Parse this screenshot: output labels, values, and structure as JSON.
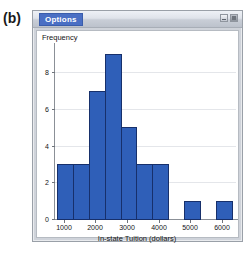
{
  "panel_label": "(b)",
  "window": {
    "options_tab_label": "Options",
    "controls": [
      {
        "name": "minimize-button",
        "glyph": "‒"
      },
      {
        "name": "close-button",
        "glyph": "■"
      }
    ]
  },
  "colors": {
    "bar_fill": "#2f5fb8",
    "bar_border": "#17306b",
    "tab_accent": "#4a6fc4",
    "window_chrome": "#cfd3da",
    "grid": "#e4e6ea",
    "axis": "#8b9097"
  },
  "chart_data": {
    "type": "bar",
    "title": "",
    "subtitle": "",
    "xlabel": "In-state Tuition (dollars)",
    "ylabel": "Frequency",
    "xlim": [
      700,
      6500
    ],
    "ylim": [
      0,
      9.6
    ],
    "xticks": [
      1000,
      2000,
      3000,
      4000,
      5000,
      6000
    ],
    "xtick_labels": [
      "1000",
      "2000",
      "3000",
      "4000",
      "5000",
      "6000"
    ],
    "yticks": [
      0,
      2,
      4,
      6,
      8
    ],
    "ytick_labels": [
      "0",
      "2",
      "4",
      "6",
      "8"
    ],
    "grid": true,
    "grid_axis": "y",
    "legend": null,
    "bin_width": 500,
    "bins": [
      {
        "left": 800,
        "right": 1300,
        "value": 3
      },
      {
        "left": 1300,
        "right": 1800,
        "value": 3
      },
      {
        "left": 1800,
        "right": 2300,
        "value": 7
      },
      {
        "left": 2300,
        "right": 2800,
        "value": 9
      },
      {
        "left": 2800,
        "right": 3300,
        "value": 5
      },
      {
        "left": 3300,
        "right": 3800,
        "value": 3
      },
      {
        "left": 3800,
        "right": 4300,
        "value": 3
      },
      {
        "left": 4800,
        "right": 5300,
        "value": 1
      },
      {
        "left": 5800,
        "right": 6300,
        "value": 1
      }
    ],
    "categories": [
      "800-1300",
      "1300-1800",
      "1800-2300",
      "2300-2800",
      "2800-3300",
      "3300-3800",
      "3800-4300",
      "4800-5300",
      "5800-6300"
    ],
    "values": [
      3,
      3,
      7,
      9,
      5,
      3,
      3,
      1,
      1
    ]
  }
}
